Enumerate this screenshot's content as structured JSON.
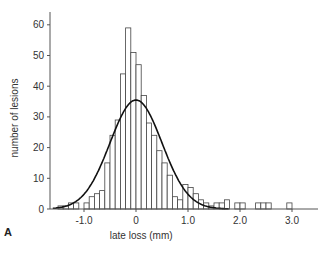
{
  "panel_label": "A",
  "chart_data": {
    "type": "bar",
    "title": "",
    "xlabel": "late loss (mm)",
    "ylabel": "number of lesions",
    "xlim": [
      -1.6,
      3.5
    ],
    "ylim": [
      0,
      66
    ],
    "xticks": [
      -1.0,
      0,
      1.0,
      2.0,
      3.0
    ],
    "xtick_labels": [
      "-1.0",
      "0",
      "1.0",
      "2.0",
      "3.0"
    ],
    "yticks": [
      0,
      10,
      20,
      30,
      40,
      50,
      60
    ],
    "ytick_labels": [
      "0",
      "10",
      "20",
      "30",
      "40",
      "50",
      "60"
    ],
    "grid": false,
    "bin_width": 0.1,
    "bins": [
      {
        "x0": -1.5,
        "count": 1
      },
      {
        "x0": -1.4,
        "count": 1
      },
      {
        "x0": -1.3,
        "count": 2
      },
      {
        "x0": -1.2,
        "count": 2
      },
      {
        "x0": -1.1,
        "count": 0
      },
      {
        "x0": -1.0,
        "count": 2
      },
      {
        "x0": -0.9,
        "count": 4
      },
      {
        "x0": -0.8,
        "count": 5
      },
      {
        "x0": -0.7,
        "count": 6
      },
      {
        "x0": -0.6,
        "count": 15
      },
      {
        "x0": -0.5,
        "count": 24
      },
      {
        "x0": -0.4,
        "count": 29
      },
      {
        "x0": -0.3,
        "count": 44
      },
      {
        "x0": -0.2,
        "count": 59
      },
      {
        "x0": -0.1,
        "count": 51
      },
      {
        "x0": 0.0,
        "count": 47
      },
      {
        "x0": 0.1,
        "count": 37
      },
      {
        "x0": 0.2,
        "count": 28
      },
      {
        "x0": 0.3,
        "count": 24
      },
      {
        "x0": 0.4,
        "count": 19
      },
      {
        "x0": 0.5,
        "count": 15
      },
      {
        "x0": 0.6,
        "count": 11
      },
      {
        "x0": 0.7,
        "count": 4
      },
      {
        "x0": 0.8,
        "count": 3
      },
      {
        "x0": 0.9,
        "count": 8
      },
      {
        "x0": 1.0,
        "count": 7
      },
      {
        "x0": 1.1,
        "count": 5
      },
      {
        "x0": 1.2,
        "count": 3
      },
      {
        "x0": 1.3,
        "count": 2
      },
      {
        "x0": 1.4,
        "count": 1
      },
      {
        "x0": 1.5,
        "count": 2
      },
      {
        "x0": 1.6,
        "count": 2
      },
      {
        "x0": 1.7,
        "count": 3
      },
      {
        "x0": 1.9,
        "count": 2
      },
      {
        "x0": 2.0,
        "count": 2
      },
      {
        "x0": 2.3,
        "count": 2
      },
      {
        "x0": 2.4,
        "count": 2
      },
      {
        "x0": 2.5,
        "count": 2
      },
      {
        "x0": 2.9,
        "count": 2
      }
    ],
    "series": [
      {
        "name": "normal fit",
        "type": "line",
        "mean": 0.0,
        "sd": 0.5,
        "peak": 35.5
      }
    ],
    "legend": null
  }
}
